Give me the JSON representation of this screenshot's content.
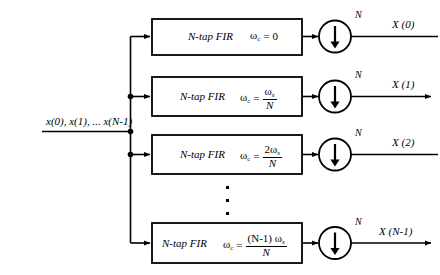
{
  "figure": {
    "type": "block-diagram",
    "input": {
      "label": "x(0), x(1), ... x(N-1)"
    },
    "branches": [
      {
        "filter_label": "N-tap FIR",
        "cutoff_lhs": "ω",
        "cutoff_sub": "c",
        "equals": "=",
        "cutoff_value_type": "plain",
        "cutoff_value": "0",
        "decimator_factor": "N",
        "output_label": "X (0)",
        "output_arrowhead": false
      },
      {
        "filter_label": "N-tap FIR",
        "cutoff_lhs": "ω",
        "cutoff_sub": "c",
        "equals": "=",
        "cutoff_value_type": "fraction",
        "numerator": "ω",
        "numerator_sub": "s",
        "numerator_prefix": "",
        "denominator": "N",
        "decimator_factor": "N",
        "output_label": "X (1)",
        "output_arrowhead": true
      },
      {
        "filter_label": "N-tap FIR",
        "cutoff_lhs": "ω",
        "cutoff_sub": "c",
        "equals": "=",
        "cutoff_value_type": "fraction",
        "numerator": "ω",
        "numerator_sub": "s",
        "numerator_prefix": "2",
        "denominator": "N",
        "decimator_factor": "N",
        "output_label": "X (2)",
        "output_arrowhead": false
      },
      {
        "filter_label": "N-tap FIR",
        "cutoff_lhs": "ω",
        "cutoff_sub": "c",
        "equals": "=",
        "cutoff_value_type": "fraction",
        "numerator": "ω",
        "numerator_sub": "s",
        "numerator_prefix": "(N-1) ",
        "denominator": "N",
        "decimator_factor": "N",
        "output_label": "X (N-1)",
        "output_arrowhead": true
      }
    ],
    "ellipsis": {
      "glyph": "·",
      "count": 3,
      "orientation": "vertical"
    },
    "colors": {
      "stroke": "#000000",
      "background": "#ffffff",
      "text": "#000000"
    }
  }
}
